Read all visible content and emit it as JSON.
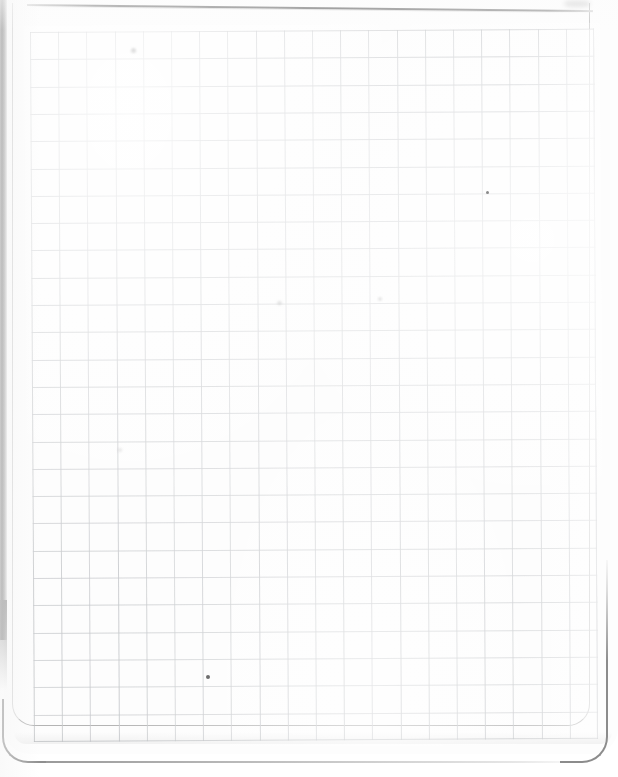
{
  "document": {
    "kind": "scanned-page",
    "title": "Blank graph paper page",
    "surface_color": "#fdfdfd",
    "page_background": "#ffffff",
    "content_text": "",
    "handwriting": "none",
    "printed_text": "none"
  },
  "grid": {
    "label": "Graph paper grid",
    "line_color": "#c7c9cc",
    "edge_line_color": "#b9bbbe",
    "columns": 20,
    "rows": 26,
    "cell_width_px": 28.2,
    "cell_height_px": 27.3,
    "origin_x_px": 30,
    "origin_y_px": 32,
    "width_px": 564,
    "height_px": 710,
    "rotation_deg": -0.32
  },
  "features": {
    "binding_strip": {
      "name": "Dark spiral-binding shadow",
      "color": "#7f7f7f",
      "edge": "left"
    },
    "top_rule": {
      "name": "Slanted page-edge line near top",
      "color": "#6f6f6f",
      "rotation_deg": 0.62
    },
    "corner_bottom_left": {
      "name": "Rounded bottom-left page corner",
      "radius_px": 26
    },
    "corner_bottom_right": {
      "name": "Rounded bottom-right page corner",
      "radius_px": 26
    }
  },
  "marks": [
    {
      "name": "pencil-dot-lower-left",
      "x": 206,
      "y": 675,
      "color": "#6d6d6d",
      "size_px": 4
    },
    {
      "name": "pencil-dot-upper-right",
      "x": 486,
      "y": 191,
      "color": "#8a8a8a",
      "size_px": 3
    },
    {
      "name": "smudge-top-right",
      "x": 564,
      "y": 0,
      "color": "#969696",
      "size_px": 26
    },
    {
      "name": "faint-speck-a",
      "x": 131,
      "y": 48,
      "color": "#a5a5a5",
      "size_px": 5
    },
    {
      "name": "faint-speck-b",
      "x": 277,
      "y": 301,
      "color": "#aaaaaa",
      "size_px": 5
    },
    {
      "name": "faint-speck-c",
      "x": 378,
      "y": 297,
      "color": "#afafaf",
      "size_px": 4
    },
    {
      "name": "faint-speck-d",
      "x": 118,
      "y": 448,
      "color": "#b4b4b4",
      "size_px": 4
    }
  ]
}
